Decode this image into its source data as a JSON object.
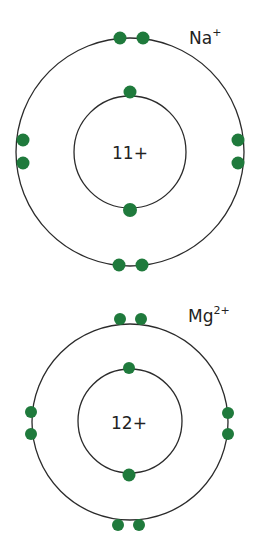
{
  "colors": {
    "electron": "#1f7a3c",
    "shell": "#2b2b2b",
    "text": "#222222",
    "background": "#ffffff"
  },
  "atoms": [
    {
      "ion_symbol": "Na",
      "ion_charge": "+",
      "nucleus_label": "11+",
      "shells": [
        {
          "name": "inner",
          "electron_count": 2
        },
        {
          "name": "outer",
          "electron_count": 8
        }
      ]
    },
    {
      "ion_symbol": "Mg",
      "ion_charge": "2+",
      "nucleus_label": "12+",
      "shells": [
        {
          "name": "inner",
          "electron_count": 2
        },
        {
          "name": "outer",
          "electron_count": 8
        }
      ]
    }
  ]
}
